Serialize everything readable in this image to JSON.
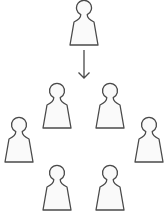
{
  "diagram": {
    "colors": {
      "stroke": "#4a4a4a",
      "fill": "#fafafa",
      "background": "#ffffff"
    },
    "source_person": {
      "x": 84,
      "y": 0
    },
    "arrow": {
      "x": 84,
      "y1": 50,
      "y2": 78,
      "direction": "down"
    },
    "group_people": [
      {
        "name": "person-mid-left",
        "x": 57,
        "y": 83
      },
      {
        "name": "person-mid-right",
        "x": 110,
        "y": 83
      },
      {
        "name": "person-far-left",
        "x": 19,
        "y": 117
      },
      {
        "name": "person-far-right",
        "x": 149,
        "y": 117
      },
      {
        "name": "person-bot-left",
        "x": 57,
        "y": 165
      },
      {
        "name": "person-bot-right",
        "x": 110,
        "y": 165
      }
    ]
  }
}
